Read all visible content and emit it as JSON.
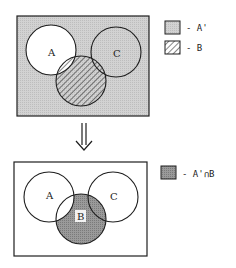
{
  "colors": {
    "stroke": "#1e1e1e",
    "shade": "#cfcfcf",
    "dark_shade": "#8f8f8f",
    "background": "#ffffff"
  },
  "top_diagram": {
    "circle_labels": {
      "a": "A",
      "b": "B",
      "c": "C"
    },
    "legend": [
      {
        "swatch": "light-shade",
        "label": "- A'"
      },
      {
        "swatch": "hatch",
        "label": "- B"
      }
    ]
  },
  "arrow": {
    "glyph": "double-down-arrow"
  },
  "bottom_diagram": {
    "circle_labels": {
      "a": "A",
      "b": "B",
      "c": "C"
    },
    "legend": [
      {
        "swatch": "dark-shade",
        "label": "- A'∩B"
      }
    ]
  }
}
